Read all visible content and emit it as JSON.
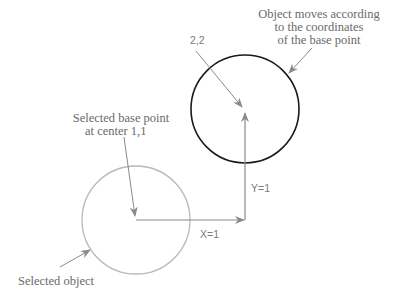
{
  "diagram": {
    "title": "",
    "labels": {
      "moved_object_line1": "Object moves according",
      "moved_object_line2": "to the coordinates",
      "moved_object_line3": "of the base point",
      "target_point": "2,2",
      "base_point_line1": "Selected base point",
      "base_point_line2": "at center 1,1",
      "y_displacement": "Y=1",
      "x_displacement": "X=1",
      "selected_object": "Selected object"
    },
    "colors": {
      "moved_circle": "#1a1a1a",
      "original_circle": "#b5b5b5",
      "arrows": "#8a8a8a",
      "text": "#6a6a6a"
    },
    "elements": {
      "original_circle": {
        "cx": 136,
        "cy": 220,
        "r": 54
      },
      "moved_circle": {
        "cx": 245,
        "cy": 109,
        "r": 54
      },
      "base_point": [
        136,
        220
      ],
      "target_point": [
        245,
        109
      ]
    }
  }
}
